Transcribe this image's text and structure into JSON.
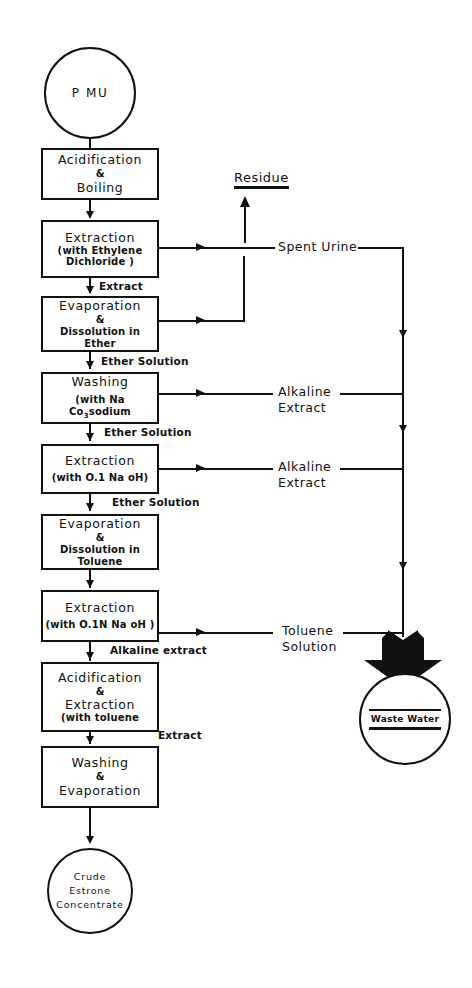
{
  "diagram": {
    "ink_color": "#111111",
    "background_color": "#ffffff"
  },
  "terminals": {
    "start": {
      "label": "P MU"
    },
    "product": {
      "line1": "Crude",
      "line2": "Estrone",
      "line3": "Concentrate"
    },
    "waste": {
      "label": "Waste Water"
    }
  },
  "process_steps": [
    {
      "id": "acidification_boiling",
      "line1": "Acidification",
      "line2": "&",
      "line3": "Boiling"
    },
    {
      "id": "extraction_ethylene_dichloride",
      "line1": "Extraction",
      "line2": "(with  Ethylene",
      "line3": "Dichloride )"
    },
    {
      "id": "evaporation_ether",
      "line1": "Evaporation",
      "line2": "&",
      "line3": "Dissolution in Ether"
    },
    {
      "id": "washing_na2co3",
      "line1": "Washing",
      "line2": "(with  Na Co",
      "line3": "sodium"
    },
    {
      "id": "extraction_01_naoh",
      "line1": "Extraction",
      "line2": "(with O.1  Na oH)"
    },
    {
      "id": "evaporation_toluene",
      "line1": "Evaporation",
      "line2": "&",
      "line3": "Dissolution in  Toluene"
    },
    {
      "id": "extraction_01n_naoh",
      "line1": "Extraction",
      "line2": "(with O.1N  Na oH )"
    },
    {
      "id": "acidification_extraction_toluene",
      "line1": "Acidification",
      "line2": "&",
      "line3": "Extraction",
      "line4": "(with  toluene"
    },
    {
      "id": "washing_evaporation",
      "line1": "Washing",
      "line2": "&",
      "line3": "Evaporation"
    }
  ],
  "stream_labels": [
    {
      "id": "extract_1",
      "text": "Extract"
    },
    {
      "id": "ether_solution_1",
      "text": "Ether Solution"
    },
    {
      "id": "ether_solution_2",
      "text": "Ether Solution"
    },
    {
      "id": "ether_solution_3",
      "text": "Ether Solution"
    },
    {
      "id": "alkaline_extract_stream",
      "text": "Alkaline extract"
    },
    {
      "id": "extract_2",
      "text": "Extract"
    }
  ],
  "side_outputs": [
    {
      "id": "residue",
      "text": "Residue"
    },
    {
      "id": "spent_urine",
      "line1": "Spent  Urine"
    },
    {
      "id": "alkaline_extract_1",
      "line1": "Alkaline",
      "line2": "Extract"
    },
    {
      "id": "alkaline_extract_2",
      "line1": "Alkaline",
      "line2": "Extract"
    },
    {
      "id": "toluene_solution",
      "line1": "Toluene",
      "line2": "Solution"
    }
  ],
  "chemistry_notes": {
    "sodium_carbonate_subscript": "3"
  }
}
